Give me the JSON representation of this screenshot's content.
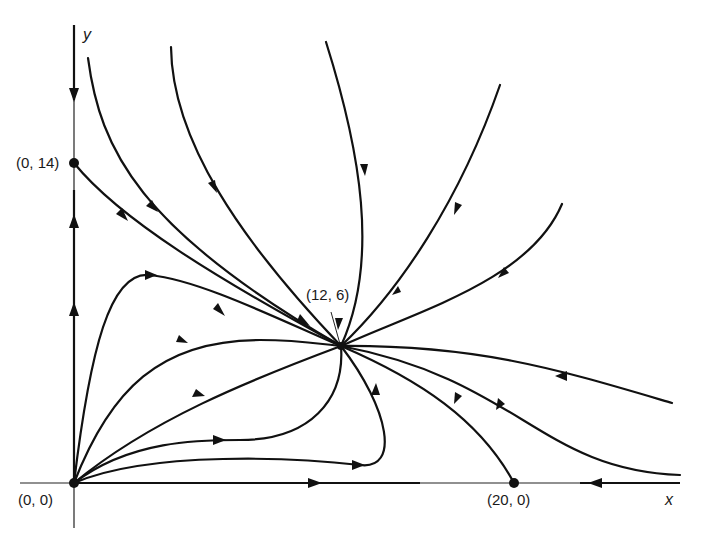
{
  "diagram": {
    "type": "phase-portrait",
    "axes": {
      "x_label": "x",
      "y_label": "y"
    },
    "equilibria": [
      {
        "label": "(0, 0)",
        "x": 0,
        "y": 0,
        "kind": "unstable-node"
      },
      {
        "label": "(0, 14)",
        "x": 0,
        "y": 14,
        "kind": "saddle"
      },
      {
        "label": "(20, 0)",
        "x": 20,
        "y": 0,
        "kind": "saddle"
      },
      {
        "label": "(12, 6)",
        "x": 12,
        "y": 6,
        "kind": "stable-node"
      }
    ],
    "colors": {
      "ink": "#111111",
      "background": "#ffffff"
    }
  }
}
